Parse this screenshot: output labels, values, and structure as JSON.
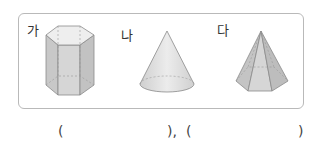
{
  "figures": [
    {
      "label": "가",
      "shape": "hexagonal-prism"
    },
    {
      "label": "나",
      "shape": "cone"
    },
    {
      "label": "다",
      "shape": "hexagonal-pyramid"
    }
  ],
  "answer_line": {
    "open1": "(",
    "close1": "),",
    "open2": "(",
    "close2": ")"
  },
  "colors": {
    "border": "#b9b9b9",
    "shape_fill": "#d9d9d9",
    "shape_stroke": "#8a8a8a"
  }
}
